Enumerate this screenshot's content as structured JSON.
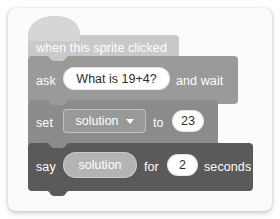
{
  "app": {
    "title": "Scratch block script",
    "background_color": "#ffffff",
    "card_color": "#fbfbfb"
  },
  "script": {
    "blocks": [
      {
        "id": "hat",
        "kind": "hat",
        "name": "when-this-sprite-clicked",
        "label": "when this sprite clicked",
        "color": "#c9c9c9",
        "text_color": "#ffffff"
      },
      {
        "id": "ask",
        "kind": "stack",
        "name": "ask-and-wait",
        "label_before": "ask",
        "label_after": "and wait",
        "input_value": "What is 19+4?",
        "input_placeholder": "What's your name?",
        "color": "#9a9a9a",
        "text_color": "#ffffff"
      },
      {
        "id": "set",
        "kind": "stack",
        "name": "set-variable-to",
        "label_before": "set",
        "label_middle": "to",
        "dropdown_value": "solution",
        "dropdown_icon": "chevron-down-icon",
        "number_value": "23",
        "color": "#8b8b8b",
        "text_color": "#ffffff"
      },
      {
        "id": "say",
        "kind": "stack",
        "name": "say-for-seconds",
        "label_before": "say",
        "label_middle": "for",
        "label_after": "seconds",
        "reporter_value": "solution",
        "number_value": "2",
        "color": "#5a5a5a",
        "text_color": "#ffffff"
      }
    ]
  }
}
